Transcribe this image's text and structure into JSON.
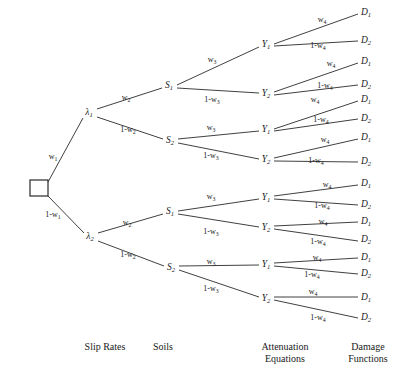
{
  "diagram": {
    "type": "logic-tree",
    "title_visible": false,
    "background_color": "#ffffff",
    "line_color": "#2a2a2a",
    "text_color": "#1a1a1a",
    "root": {
      "shape": "square",
      "label": ""
    },
    "columns": [
      {
        "key": "slip_rates",
        "label": "Slip Rates",
        "center_x": 105
      },
      {
        "key": "soils",
        "label": "Soils",
        "center_x": 163
      },
      {
        "key": "attenuation",
        "label": "Attenuation\nEquations",
        "center_x": 285
      },
      {
        "key": "damage",
        "label": "Damage\nFunctions",
        "center_x": 368
      }
    ],
    "nodes": [
      {
        "id": "root",
        "text": "",
        "x": 39,
        "y": 188,
        "kind": "root-square"
      },
      {
        "id": "lambda1",
        "base": "λ",
        "sub": "1",
        "x": 89,
        "y": 113,
        "kind": "node"
      },
      {
        "id": "lambda2",
        "base": "λ",
        "sub": "2",
        "x": 90,
        "y": 237,
        "kind": "node"
      },
      {
        "id": "s1a",
        "base": "S",
        "sub": "1",
        "x": 169,
        "y": 86,
        "kind": "node"
      },
      {
        "id": "s2a",
        "base": "S",
        "sub": "2",
        "x": 170,
        "y": 141,
        "kind": "node"
      },
      {
        "id": "s1b",
        "base": "S",
        "sub": "1",
        "x": 170,
        "y": 212,
        "kind": "node"
      },
      {
        "id": "s2b",
        "base": "S",
        "sub": "2",
        "x": 171,
        "y": 268,
        "kind": "node"
      },
      {
        "id": "y1a",
        "base": "Y",
        "sub": "1",
        "x": 266,
        "y": 45,
        "kind": "node"
      },
      {
        "id": "y2a",
        "base": "Y",
        "sub": "2",
        "x": 266,
        "y": 94,
        "kind": "node"
      },
      {
        "id": "y1b",
        "base": "Y",
        "sub": "1",
        "x": 266,
        "y": 130,
        "kind": "node"
      },
      {
        "id": "y2b",
        "base": "Y",
        "sub": "2",
        "x": 266,
        "y": 160,
        "kind": "node"
      },
      {
        "id": "y1c",
        "base": "Y",
        "sub": "1",
        "x": 266,
        "y": 198,
        "kind": "node"
      },
      {
        "id": "y2c",
        "base": "Y",
        "sub": "2",
        "x": 266,
        "y": 228,
        "kind": "node"
      },
      {
        "id": "y1d",
        "base": "Y",
        "sub": "1",
        "x": 266,
        "y": 265,
        "kind": "node"
      },
      {
        "id": "y2d",
        "base": "Y",
        "sub": "2",
        "x": 266,
        "y": 299,
        "kind": "node"
      },
      {
        "id": "d1_1",
        "base": "D",
        "sub": "1",
        "x": 366,
        "y": 13,
        "kind": "leaf"
      },
      {
        "id": "d2_1",
        "base": "D",
        "sub": "2",
        "x": 366,
        "y": 41,
        "kind": "leaf"
      },
      {
        "id": "d1_2",
        "base": "D",
        "sub": "1",
        "x": 366,
        "y": 62,
        "kind": "leaf"
      },
      {
        "id": "d2_2",
        "base": "D",
        "sub": "2",
        "x": 366,
        "y": 85,
        "kind": "leaf"
      },
      {
        "id": "d1_3",
        "base": "D",
        "sub": "1",
        "x": 366,
        "y": 100,
        "kind": "leaf"
      },
      {
        "id": "d2_3",
        "base": "D",
        "sub": "2",
        "x": 366,
        "y": 119,
        "kind": "leaf"
      },
      {
        "id": "d1_4",
        "base": "D",
        "sub": "1",
        "x": 366,
        "y": 138,
        "kind": "leaf"
      },
      {
        "id": "d2_4",
        "base": "D",
        "sub": "2",
        "x": 366,
        "y": 162,
        "kind": "leaf"
      },
      {
        "id": "d1_5",
        "base": "D",
        "sub": "1",
        "x": 366,
        "y": 184,
        "kind": "leaf"
      },
      {
        "id": "d2_5",
        "base": "D",
        "sub": "2",
        "x": 366,
        "y": 205,
        "kind": "leaf"
      },
      {
        "id": "d1_6",
        "base": "D",
        "sub": "1",
        "x": 366,
        "y": 222,
        "kind": "leaf"
      },
      {
        "id": "d2_6",
        "base": "D",
        "sub": "2",
        "x": 366,
        "y": 240,
        "kind": "leaf"
      },
      {
        "id": "d1_7",
        "base": "D",
        "sub": "1",
        "x": 366,
        "y": 258,
        "kind": "leaf"
      },
      {
        "id": "d2_7",
        "base": "D",
        "sub": "2",
        "x": 366,
        "y": 274,
        "kind": "leaf"
      },
      {
        "id": "d1_8",
        "base": "D",
        "sub": "1",
        "x": 366,
        "y": 298,
        "kind": "leaf"
      },
      {
        "id": "d2_8",
        "base": "D",
        "sub": "2",
        "x": 366,
        "y": 318,
        "kind": "leaf"
      }
    ],
    "edges": [
      {
        "from": "root",
        "to": "lambda1",
        "x1": 48,
        "y1": 182,
        "x2": 83,
        "y2": 118
      },
      {
        "from": "root",
        "to": "lambda2",
        "x1": 48,
        "y1": 196,
        "x2": 84,
        "y2": 233
      },
      {
        "from": "lambda1",
        "to": "s1a",
        "x1": 97,
        "y1": 109,
        "x2": 162,
        "y2": 88
      },
      {
        "from": "lambda1",
        "to": "s2a",
        "x1": 97,
        "y1": 117,
        "x2": 163,
        "y2": 139
      },
      {
        "from": "lambda2",
        "to": "s1b",
        "x1": 98,
        "y1": 233,
        "x2": 163,
        "y2": 214
      },
      {
        "from": "lambda2",
        "to": "s2b",
        "x1": 98,
        "y1": 241,
        "x2": 164,
        "y2": 266
      },
      {
        "from": "s1a",
        "to": "y1a",
        "x1": 177,
        "y1": 85,
        "x2": 259,
        "y2": 47
      },
      {
        "from": "s1a",
        "to": "y2a",
        "x1": 177,
        "y1": 88,
        "x2": 259,
        "y2": 93
      },
      {
        "from": "s2a",
        "to": "y1b",
        "x1": 178,
        "y1": 139,
        "x2": 259,
        "y2": 131
      },
      {
        "from": "s2a",
        "to": "y2b",
        "x1": 178,
        "y1": 143,
        "x2": 259,
        "y2": 159
      },
      {
        "from": "s1b",
        "to": "y1c",
        "x1": 178,
        "y1": 211,
        "x2": 259,
        "y2": 199
      },
      {
        "from": "s1b",
        "to": "y2c",
        "x1": 178,
        "y1": 214,
        "x2": 259,
        "y2": 227
      },
      {
        "from": "s2b",
        "to": "y1d",
        "x1": 179,
        "y1": 266,
        "x2": 259,
        "y2": 265
      },
      {
        "from": "s2b",
        "to": "y2d",
        "x1": 179,
        "y1": 270,
        "x2": 259,
        "y2": 297
      },
      {
        "from": "y1a",
        "to": "d1_1",
        "x1": 274,
        "y1": 44,
        "x2": 358,
        "y2": 14
      },
      {
        "from": "y1a",
        "to": "d2_1",
        "x1": 274,
        "y1": 46,
        "x2": 358,
        "y2": 41
      },
      {
        "from": "y2a",
        "to": "d1_2",
        "x1": 274,
        "y1": 92,
        "x2": 358,
        "y2": 63
      },
      {
        "from": "y2a",
        "to": "d2_2",
        "x1": 274,
        "y1": 95,
        "x2": 358,
        "y2": 85
      },
      {
        "from": "y1b",
        "to": "d1_3",
        "x1": 274,
        "y1": 129,
        "x2": 358,
        "y2": 101
      },
      {
        "from": "y1b",
        "to": "d2_3",
        "x1": 274,
        "y1": 131,
        "x2": 358,
        "y2": 119
      },
      {
        "from": "y2b",
        "to": "d1_4",
        "x1": 274,
        "y1": 158,
        "x2": 358,
        "y2": 139
      },
      {
        "from": "y2b",
        "to": "d2_4",
        "x1": 274,
        "y1": 161,
        "x2": 358,
        "y2": 162
      },
      {
        "from": "y1c",
        "to": "d1_5",
        "x1": 274,
        "y1": 196,
        "x2": 358,
        "y2": 185
      },
      {
        "from": "y1c",
        "to": "d2_5",
        "x1": 274,
        "y1": 199,
        "x2": 358,
        "y2": 205
      },
      {
        "from": "y2c",
        "to": "d1_6",
        "x1": 274,
        "y1": 226,
        "x2": 358,
        "y2": 222
      },
      {
        "from": "y2c",
        "to": "d2_6",
        "x1": 274,
        "y1": 229,
        "x2": 358,
        "y2": 241
      },
      {
        "from": "y1d",
        "to": "d1_7",
        "x1": 274,
        "y1": 263,
        "x2": 358,
        "y2": 258
      },
      {
        "from": "y1d",
        "to": "d2_7",
        "x1": 274,
        "y1": 266,
        "x2": 358,
        "y2": 274
      },
      {
        "from": "y2d",
        "to": "d1_8",
        "x1": 274,
        "y1": 297,
        "x2": 358,
        "y2": 297
      },
      {
        "from": "y2d",
        "to": "d2_8",
        "x1": 274,
        "y1": 300,
        "x2": 358,
        "y2": 318
      }
    ],
    "branch_labels": [
      {
        "id": "bl1",
        "base": "w",
        "sub": "4",
        "prefix": "",
        "x": 322,
        "y": 20
      },
      {
        "id": "bl2",
        "base": "w",
        "sub": "4",
        "prefix": "1-",
        "x": 318,
        "y": 46
      },
      {
        "id": "bl3",
        "base": "w",
        "sub": "4",
        "prefix": "",
        "x": 331,
        "y": 64
      },
      {
        "id": "bl4",
        "base": "w",
        "sub": "4",
        "prefix": "1-",
        "x": 325,
        "y": 86
      },
      {
        "id": "bl5",
        "base": "w",
        "sub": "4",
        "prefix": "",
        "x": 315,
        "y": 100
      },
      {
        "id": "bl6",
        "base": "w",
        "sub": "4",
        "prefix": "1-",
        "x": 321,
        "y": 120
      },
      {
        "id": "bl7",
        "base": "w",
        "sub": "4",
        "prefix": "",
        "x": 325,
        "y": 140
      },
      {
        "id": "bl8",
        "base": "w",
        "sub": "4",
        "prefix": "1-",
        "x": 316,
        "y": 161
      },
      {
        "id": "bl9",
        "base": "w",
        "sub": "4",
        "prefix": "",
        "x": 327,
        "y": 185
      },
      {
        "id": "bl10",
        "base": "w",
        "sub": "4",
        "prefix": "1-",
        "x": 322,
        "y": 206
      },
      {
        "id": "bl11",
        "base": "w",
        "sub": "4",
        "prefix": "",
        "x": 323,
        "y": 222
      },
      {
        "id": "bl12",
        "base": "w",
        "sub": "4",
        "prefix": "1-",
        "x": 318,
        "y": 242
      },
      {
        "id": "bl13",
        "base": "w",
        "sub": "4",
        "prefix": "",
        "x": 317,
        "y": 258
      },
      {
        "id": "bl14",
        "base": "w",
        "sub": "4",
        "prefix": "1-",
        "x": 312,
        "y": 275
      },
      {
        "id": "bl15",
        "base": "w",
        "sub": "4",
        "prefix": "",
        "x": 313,
        "y": 292
      },
      {
        "id": "bl16",
        "base": "w",
        "sub": "4",
        "prefix": "1-",
        "x": 318,
        "y": 318
      },
      {
        "id": "bw3a",
        "base": "w",
        "sub": "3",
        "prefix": "",
        "x": 212,
        "y": 60
      },
      {
        "id": "bw3b",
        "base": "w",
        "sub": "3",
        "prefix": "1-",
        "x": 212,
        "y": 100
      },
      {
        "id": "bw3c",
        "base": "w",
        "sub": "3",
        "prefix": "",
        "x": 211,
        "y": 128
      },
      {
        "id": "bw3d",
        "base": "w",
        "sub": "3",
        "prefix": "1-",
        "x": 211,
        "y": 156
      },
      {
        "id": "bw3e",
        "base": "w",
        "sub": "3",
        "prefix": "",
        "x": 211,
        "y": 197
      },
      {
        "id": "bw3f",
        "base": "w",
        "sub": "3",
        "prefix": "1-",
        "x": 211,
        "y": 232
      },
      {
        "id": "bw3g",
        "base": "w",
        "sub": "3",
        "prefix": "",
        "x": 211,
        "y": 262
      },
      {
        "id": "bw3h",
        "base": "w",
        "sub": "3",
        "prefix": "1-",
        "x": 211,
        "y": 289
      },
      {
        "id": "bw2a",
        "base": "w",
        "sub": "2",
        "prefix": "",
        "x": 126,
        "y": 98
      },
      {
        "id": "bw2b",
        "base": "w",
        "sub": "2",
        "prefix": "1-",
        "x": 128,
        "y": 130
      },
      {
        "id": "bw2c",
        "base": "w",
        "sub": "2",
        "prefix": "",
        "x": 127,
        "y": 223
      },
      {
        "id": "bw2d",
        "base": "w",
        "sub": "2",
        "prefix": "1-",
        "x": 128,
        "y": 255
      },
      {
        "id": "bw1a",
        "base": "w",
        "sub": "1",
        "prefix": "",
        "x": 53,
        "y": 157
      },
      {
        "id": "bw1b",
        "base": "w",
        "sub": "1",
        "prefix": "1-",
        "x": 53,
        "y": 215
      }
    ],
    "column_labels": [
      {
        "key": "slip_rates",
        "text": "Slip Rates",
        "x": 105,
        "y": 341
      },
      {
        "key": "soils",
        "text": "Soils",
        "x": 163,
        "y": 341
      },
      {
        "key": "attenuation",
        "text": "Attenuation\nEquations",
        "x": 285,
        "y": 341
      },
      {
        "key": "damage",
        "text": "Damage\nFunctions",
        "x": 368,
        "y": 341
      }
    ]
  }
}
